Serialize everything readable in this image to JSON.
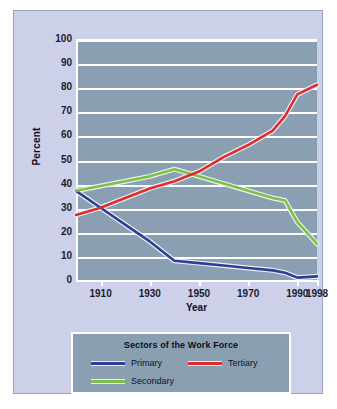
{
  "chart_data": {
    "type": "line",
    "title": "Sectors of the Work Force",
    "xlabel": "Year",
    "ylabel": "Percent",
    "xlim": [
      1900,
      1998
    ],
    "ylim": [
      0,
      100
    ],
    "grid": true,
    "legend_position": "bottom",
    "x_ticks": [
      "1910",
      "1930",
      "1950",
      "1970",
      "1990",
      "1998"
    ],
    "x_tick_values": [
      1910,
      1930,
      1950,
      1970,
      1990,
      1998
    ],
    "y_ticks": [
      "0",
      "10",
      "20",
      "30",
      "40",
      "50",
      "60",
      "70",
      "80",
      "90",
      "100"
    ],
    "y_tick_values": [
      0,
      10,
      20,
      30,
      40,
      50,
      60,
      70,
      80,
      90,
      100
    ],
    "series": [
      {
        "name": "Primary",
        "color": "#2d3f92",
        "x": [
          1900,
          1910,
          1920,
          1930,
          1940,
          1950,
          1960,
          1970,
          1980,
          1985,
          1990,
          1998
        ],
        "values": [
          37,
          30,
          23,
          16,
          8,
          7,
          6,
          5,
          4,
          3,
          1,
          1.5
        ]
      },
      {
        "name": "Secondary",
        "color": "#7cc142",
        "x": [
          1900,
          1910,
          1920,
          1930,
          1940,
          1950,
          1960,
          1970,
          1980,
          1985,
          1990,
          1998
        ],
        "values": [
          37,
          39,
          41,
          43,
          46,
          43,
          40,
          37,
          34,
          33,
          24,
          15
        ]
      },
      {
        "name": "Tertiary",
        "color": "#e02b2b",
        "x": [
          1900,
          1910,
          1920,
          1930,
          1940,
          1950,
          1960,
          1970,
          1980,
          1985,
          1990,
          1998
        ],
        "values": [
          27,
          30,
          34,
          38,
          41,
          45,
          51,
          56,
          62,
          68,
          77,
          81
        ]
      }
    ]
  },
  "legend": {
    "title": "Sectors of the Work Force",
    "entries": [
      {
        "label": "Primary",
        "color": "#2d3f92"
      },
      {
        "label": "Tertiary",
        "color": "#e02b2b"
      },
      {
        "label": "Secondary",
        "color": "#7cc142"
      }
    ]
  },
  "axes": {
    "y_title": "Percent",
    "x_title": "Year"
  },
  "colors": {
    "page_background": "#ccd0e8",
    "plot_background": "#8aa0b2",
    "gridline": "#ffffff",
    "text": "#1b1b2e",
    "primary": "#2d3f92",
    "secondary": "#7cc142",
    "tertiary": "#e02b2b"
  }
}
